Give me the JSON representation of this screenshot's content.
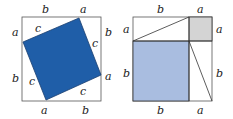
{
  "colors": {
    "frame": "#555555",
    "dark_blue": "#1f5ea8",
    "light_blue": "#a9bde0",
    "grey": "#d4d4d4",
    "line": "#333333"
  },
  "left_diagram": {
    "labels": {
      "top_b": "b",
      "top_a": "a",
      "left_a": "a",
      "left_b": "b",
      "right_b": "b",
      "right_a": "a",
      "bottom_a": "a",
      "bottom_b": "b",
      "c_top": "c",
      "c_right": "c",
      "c_left": "c",
      "c_bottom": "c"
    }
  },
  "right_diagram": {
    "labels": {
      "top_b": "b",
      "top_a": "a",
      "left_a": "a",
      "left_b": "b",
      "right_a": "a",
      "right_b": "b",
      "bottom_b": "b",
      "bottom_a": "a"
    }
  }
}
